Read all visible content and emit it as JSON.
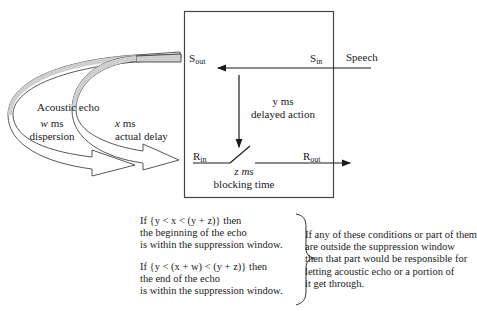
{
  "diagram": {
    "ports": {
      "s_out": {
        "base": "S",
        "sub": "out"
      },
      "s_in": {
        "base": "S",
        "sub": "in"
      },
      "r_in": {
        "base": "R",
        "sub": "in"
      },
      "r_out": {
        "base": "R",
        "sub": "out"
      }
    },
    "speech_label": "Speech",
    "delayed_action": {
      "line1": "y ms",
      "line2": "delayed action"
    },
    "blocking_time": {
      "line1": "z ms",
      "line2": "blocking time"
    },
    "acoustic_echo_label": "Acoustic echo",
    "dispersion": {
      "var": "w",
      "unit": "ms",
      "line2": "dispersion"
    },
    "actual_delay": {
      "var": "x",
      "unit": "ms",
      "line2": "actual delay"
    }
  },
  "conditions": [
    {
      "line1": "If {y < x < (y + z)} then",
      "line2": "the beginning of the echo",
      "line3": "is within the suppression window."
    },
    {
      "line1": "If {y < (x + w) < (y + z)} then",
      "line2": "the end of the echo",
      "line3": "is within the suppression window."
    }
  ],
  "conclusion": [
    "If any of these conditions or part of them",
    "are outside the suppression window",
    "then that part would be responsible for",
    "letting acoustic echo or a portion of",
    "it get through."
  ]
}
